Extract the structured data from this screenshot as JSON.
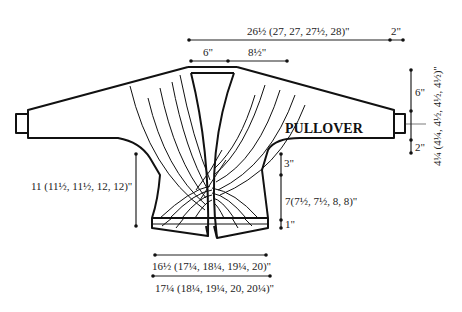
{
  "diagram": {
    "title": "PULLOVER",
    "measurements": {
      "total_width": "26½ (27, 27, 27½, 28)\"",
      "cuff_width": "2\"",
      "neck_half": "6\"",
      "shoulder": "8½\"",
      "sleeve_top_depth": "6\"",
      "cuff_depth": "2\"",
      "sleeve_total_depth": "4¼ (4¼, 4½, 4½, 4½)\"",
      "body_length_left": "11 (11½, 11½, 12, 12)\"",
      "armhole_upper": "3\"",
      "body_length_right": "7(7½, 7½, 8, 8)\"",
      "band_height": "1\"",
      "hem_width_upper": "16½ (17¼, 18¼, 19¼, 20)\"",
      "hem_width_lower": "17¼ (18¼, 19¼, 20, 20¼)\""
    },
    "colors": {
      "line": "#111111",
      "background": "#ffffff"
    }
  }
}
